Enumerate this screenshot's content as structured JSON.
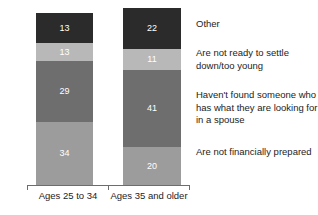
{
  "chart_data": {
    "type": "bar",
    "subtype": "stacked-bar",
    "title": "",
    "subtitle": "",
    "xlabel": "",
    "ylabel": "",
    "ylim": [
      0,
      100
    ],
    "grid": false,
    "legend_position": "right",
    "categories": [
      "Ages 25 to 34",
      "Ages 35 and older"
    ],
    "series": [
      {
        "name": "Are not financially prepared",
        "values": [
          34,
          20
        ],
        "color": "#9c9c9c"
      },
      {
        "name": "Haven't found someone who has what they are looking for in a spouse",
        "values": [
          29,
          41
        ],
        "color": "#6e6e6e"
      },
      {
        "name": "Are not ready to settle down/too young",
        "values": [
          13,
          11
        ],
        "color": "#b8b8b8"
      },
      {
        "name": "Other",
        "values": [
          13,
          22
        ],
        "color": "#2b2b2b"
      }
    ],
    "stack_order_top_to_bottom": [
      "Other",
      "Are not ready to settle down/too young",
      "Haven't found someone who has what they are looking for in a spouse",
      "Are not financially prepared"
    ],
    "value_label_color": "#ffffff",
    "axis_color": "#6d6d6d",
    "background": "#ffffff"
  },
  "bars": [
    {
      "category": "Ages 25 to 34",
      "segments": [
        {
          "key": "other",
          "value": "13",
          "color": "#2b2b2b",
          "height_px": 30
        },
        {
          "key": "not-ready",
          "value": "13",
          "color": "#b8b8b8",
          "height_px": 18
        },
        {
          "key": "havent-found",
          "value": "29",
          "color": "#6e6e6e",
          "height_px": 61
        },
        {
          "key": "not-financially",
          "value": "34",
          "color": "#9c9c9c",
          "height_px": 63
        }
      ]
    },
    {
      "category": "Ages 35 and older",
      "segments": [
        {
          "key": "other",
          "value": "22",
          "color": "#2b2b2b",
          "height_px": 41
        },
        {
          "key": "not-ready",
          "value": "11",
          "color": "#b8b8b8",
          "height_px": 21
        },
        {
          "key": "havent-found",
          "value": "41",
          "color": "#6e6e6e",
          "height_px": 77
        },
        {
          "key": "not-financially",
          "value": "20",
          "color": "#9c9c9c",
          "height_px": 38
        }
      ]
    }
  ],
  "axis": {
    "categories": [
      {
        "label": "Ages 25 to 34"
      },
      {
        "label": "Ages 35 and older"
      }
    ]
  },
  "legend": {
    "items": [
      {
        "label": "Other",
        "color": "#2b2b2b"
      },
      {
        "label": "Are not ready to settle down/too young",
        "color": "#b8b8b8"
      },
      {
        "label": "Haven't found someone who has what they are looking for in a spouse",
        "color": "#6e6e6e"
      },
      {
        "label": "Are not financially prepared",
        "color": "#9c9c9c"
      }
    ]
  }
}
